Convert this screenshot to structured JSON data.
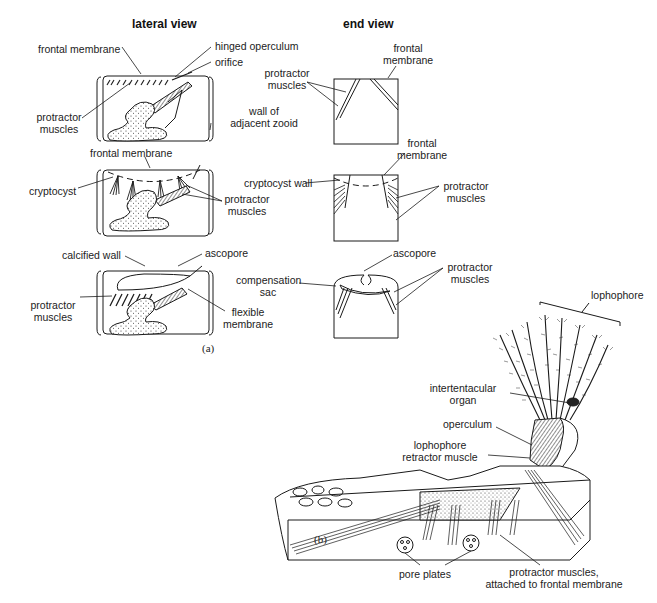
{
  "figure": {
    "panel_a": {
      "tag": "(a)",
      "headers": {
        "lateral": "lateral view",
        "end": "end view"
      },
      "row1": {
        "lateral_labels": {
          "frontal_membrane": "frontal membrane",
          "hinged_operculum": "hinged operculum",
          "orifice": "orifice",
          "protractor_muscles_1": "protractor",
          "protractor_muscles_2": "muscles",
          "wall_1": "wall of",
          "wall_2": "adjacent zooid"
        },
        "end_labels": {
          "protractor_1": "protractor",
          "protractor_2": "muscles",
          "frontal_1": "frontal",
          "frontal_2": "membrane"
        }
      },
      "row2": {
        "lateral_labels": {
          "frontal_membrane": "frontal membrane",
          "cryptocyst": "cryptocyst",
          "protractor_1": "protractor",
          "protractor_2": "muscles"
        },
        "end_labels": {
          "frontal_1": "frontal",
          "frontal_2": "membrane",
          "cryptocyst_wall": "cryptocyst wall",
          "protractor_1": "protractor",
          "protractor_2": "muscles"
        }
      },
      "row3": {
        "lateral_labels": {
          "calcified_wall": "calcified wall",
          "ascopore": "ascopore",
          "protractor_1": "protractor",
          "protractor_2": "muscles",
          "flexible_1": "flexible",
          "flexible_2": "membrane"
        },
        "end_labels": {
          "ascopore": "ascopore",
          "compensation_1": "compensation",
          "compensation_2": "sac",
          "protractor_1": "protractor",
          "protractor_2": "muscles"
        }
      }
    },
    "panel_b": {
      "tag": "(b)",
      "labels": {
        "lophophore": "lophophore",
        "intertentacular_1": "intertentacular",
        "intertentacular_2": "organ",
        "operculum": "operculum",
        "retractor_1": "lophophore",
        "retractor_2": "retractor muscle",
        "pore_plates": "pore plates",
        "protractor_1": "protractor muscles,",
        "protractor_2": "attached to frontal membrane"
      }
    }
  }
}
